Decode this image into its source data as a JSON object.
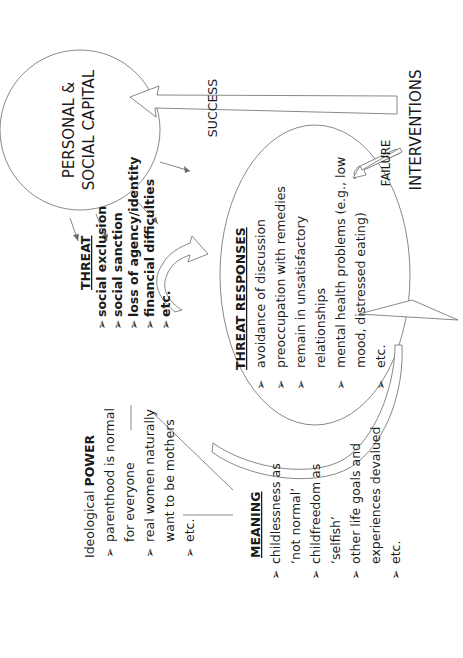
{
  "diagram": {
    "capital_circle": {
      "line1": "PERSONAL &",
      "line2": "SOCIAL CAPITAL"
    },
    "success_label": "SUCCESS",
    "failure_label": "FAILURE",
    "interventions_label": "INTERVENTIONS",
    "threat": {
      "heading": "THREAT",
      "items": [
        "social exclusion",
        "social sanction",
        "loss of agency/identity",
        "financial difficulties",
        "etc."
      ]
    },
    "threat_responses": {
      "heading": "THREAT RESPONSES",
      "lines": [
        {
          "bullet": true,
          "text": "avoidance of discussion"
        },
        {
          "bullet": true,
          "text": "preoccupation with remedies"
        },
        {
          "bullet": true,
          "text": "remain in unsatisfactory"
        },
        {
          "bullet": false,
          "text": "relationships"
        },
        {
          "bullet": true,
          "text": "mental health problems (e.g., low"
        },
        {
          "bullet": false,
          "text": "mood, distressed eating)"
        },
        {
          "bullet": true,
          "text": "etc."
        }
      ]
    },
    "power": {
      "heading_normal": "Ideological ",
      "heading_bold": "POWER",
      "lines": [
        {
          "bullet": true,
          "text": "parenthood is normal"
        },
        {
          "bullet": false,
          "text": "for everyone"
        },
        {
          "bullet": true,
          "text": "real women naturally"
        },
        {
          "bullet": false,
          "text": "want to be mothers"
        },
        {
          "bullet": true,
          "text": "etc."
        }
      ]
    },
    "meaning": {
      "heading": "MEANING",
      "lines": [
        {
          "bullet": true,
          "text": "childlessness as"
        },
        {
          "bullet": false,
          "text": "‘not normal’"
        },
        {
          "bullet": true,
          "text": "childfreedom as"
        },
        {
          "bullet": false,
          "text": "‘selfish’"
        },
        {
          "bullet": true,
          "text": "other life goals and"
        },
        {
          "bullet": false,
          "text": "experiences devalued"
        },
        {
          "bullet": true,
          "text": "etc."
        }
      ]
    },
    "bullet_glyph": "➢"
  }
}
